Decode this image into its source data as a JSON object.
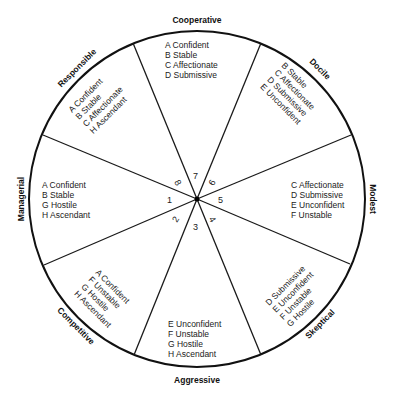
{
  "diagram": {
    "type": "interpersonal-circle",
    "segments": [
      {
        "number": "1",
        "title": "Managerial",
        "traits": [
          "A  Confident",
          "B  Stable",
          "G  Hostile",
          "H  Ascendant"
        ]
      },
      {
        "number": "2",
        "title": "Competitive",
        "traits": [
          "A  Confident",
          "F  Unstable",
          "G  Hostile",
          "H  Ascendant"
        ]
      },
      {
        "number": "3",
        "title": "Aggressive",
        "traits": [
          "E  Unconfident",
          "F  Unstable",
          "G  Hostile",
          "H  Ascendant"
        ]
      },
      {
        "number": "4",
        "title": "Skeptical",
        "traits": [
          "D  Submissive",
          "E  Unconfident",
          "F  Unstable",
          "G  Hostile"
        ]
      },
      {
        "number": "5",
        "title": "Modest",
        "traits": [
          "C  Affectionate",
          "D  Submissive",
          "E  Unconfident",
          "F  Unstable"
        ]
      },
      {
        "number": "6",
        "title": "Docile",
        "traits": [
          "B  Stable",
          "C  Affectionate",
          "D  Submissive",
          "E  Unconfident"
        ]
      },
      {
        "number": "7",
        "title": "Cooperative",
        "traits": [
          "A  Confident",
          "B  Stable",
          "C  Affectionate",
          "D  Submissive"
        ]
      },
      {
        "number": "8",
        "title": "Responsible",
        "traits": [
          "A  Confident",
          "B  Stable",
          "C  Affectionate",
          "H  Ascendant"
        ]
      }
    ]
  },
  "colors": {
    "ink": "#1a1a1a",
    "background": "#ffffff"
  }
}
